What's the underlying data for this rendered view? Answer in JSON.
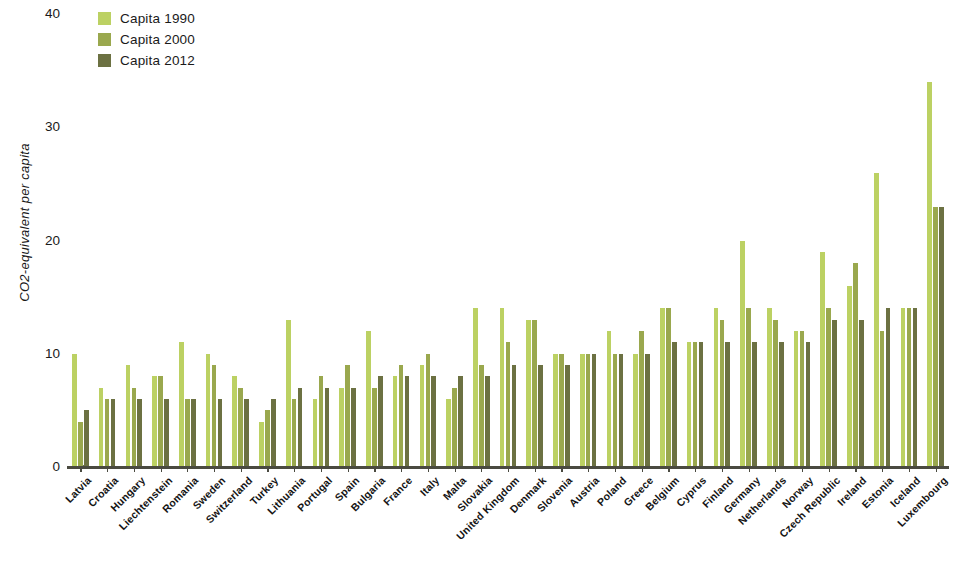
{
  "chart_data": {
    "type": "bar",
    "title": "",
    "subtitle": "",
    "xlabel": "",
    "ylabel": "CO2-equivalent per capita",
    "ylim": [
      0,
      40
    ],
    "yticks": [
      0,
      10,
      20,
      30,
      40
    ],
    "grid": false,
    "legend_position": "top-left",
    "categories": [
      "Latvia",
      "Croatia",
      "Hungary",
      "Liechtenstein",
      "Romania",
      "Sweden",
      "Switzerland",
      "Turkey",
      "Lithuania",
      "Portugal",
      "Spain",
      "Bulgaria",
      "France",
      "Italy",
      "Malta",
      "Slovakia",
      "United Kingdom",
      "Denmark",
      "Slovenia",
      "Austria",
      "Poland",
      "Greece",
      "Belgium",
      "Cyprus",
      "Finland",
      "Germany",
      "Netherlands",
      "Norway",
      "Czech Republic",
      "Ireland",
      "Estonia",
      "Iceland",
      "Luxembourg"
    ],
    "series": [
      {
        "name": "Capita 1990",
        "color": "#bcd163",
        "values": [
          10,
          7,
          9,
          8,
          11,
          10,
          8,
          4,
          13,
          6,
          7,
          12,
          8,
          9,
          6,
          14,
          14,
          13,
          10,
          10,
          12,
          10,
          14,
          11,
          14,
          20,
          14,
          12,
          19,
          16,
          26,
          14,
          34
        ]
      },
      {
        "name": "Capita 2000",
        "color": "#9aa84e",
        "values": [
          4,
          6,
          7,
          8,
          6,
          9,
          7,
          5,
          6,
          8,
          9,
          7,
          9,
          10,
          7,
          9,
          11,
          13,
          10,
          10,
          10,
          12,
          14,
          11,
          13,
          14,
          13,
          12,
          14,
          18,
          12,
          14,
          23
        ]
      },
      {
        "name": "Capita 2012",
        "color": "#6c7142",
        "values": [
          5,
          6,
          6,
          6,
          6,
          6,
          6,
          6,
          7,
          7,
          7,
          8,
          8,
          8,
          8,
          8,
          9,
          9,
          9,
          10,
          10,
          10,
          11,
          11,
          11,
          11,
          11,
          11,
          13,
          13,
          14,
          14,
          23
        ]
      }
    ]
  }
}
